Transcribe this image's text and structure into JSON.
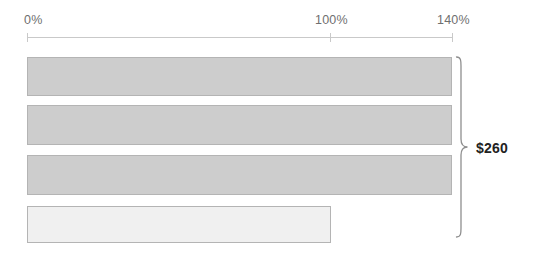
{
  "chart_data": {
    "type": "bar",
    "orientation": "horizontal",
    "title": "",
    "xlabel": "",
    "ylabel": "",
    "categories": [
      "Bar 1",
      "Bar 2",
      "Bar 3",
      "Bar 4"
    ],
    "values": [
      140,
      140,
      140,
      100
    ],
    "value_unit": "%",
    "xlim": [
      0,
      140
    ],
    "grid": false,
    "legend": null,
    "axis": {
      "ticks": [
        {
          "value": 0,
          "label": "0%"
        },
        {
          "value": 100,
          "label": "100%"
        },
        {
          "value": 140,
          "label": "140%"
        }
      ],
      "line_color": "#c9c9c9",
      "label_color": "#6f6f6f"
    },
    "bars": [
      {
        "name": "bar-1",
        "value": 140,
        "fill": "#cdcdcd",
        "stroke": "#b4b4b4",
        "top": 57,
        "height": 39
      },
      {
        "name": "bar-2",
        "value": 140,
        "fill": "#cdcdcd",
        "stroke": "#b4b4b4",
        "top": 105,
        "height": 40
      },
      {
        "name": "bar-3",
        "value": 140,
        "fill": "#cdcdcd",
        "stroke": "#b4b4b4",
        "top": 155,
        "height": 40
      },
      {
        "name": "bar-4",
        "value": 100,
        "fill": "#f0f0f0",
        "stroke": "#b4b4b4",
        "top": 206,
        "height": 37
      }
    ],
    "annotations": [
      {
        "name": "bracket-annotation",
        "type": "curly-brace",
        "label": "$260",
        "spans_bars": [
          "bar-1",
          "bar-2",
          "bar-3",
          "bar-4"
        ],
        "color": "#222222"
      }
    ]
  }
}
